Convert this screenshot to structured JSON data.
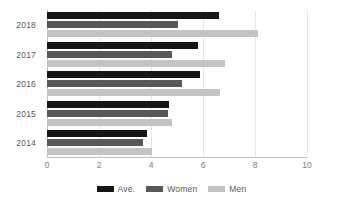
{
  "chart_data": {
    "type": "bar",
    "orientation": "horizontal",
    "title": "",
    "subtitle": "",
    "xlabel": "",
    "ylabel": "",
    "categories": [
      "2018",
      "2017",
      "2016",
      "2015",
      "2014"
    ],
    "series": [
      {
        "name": "Ave.",
        "color": "#161616",
        "values": [
          6.6,
          5.8,
          5.9,
          4.7,
          3.85
        ]
      },
      {
        "name": "Women",
        "color": "#585858",
        "values": [
          5.05,
          4.8,
          5.2,
          4.65,
          3.7
        ]
      },
      {
        "name": "Men",
        "color": "#c4c4c4",
        "values": [
          8.1,
          6.85,
          6.65,
          4.8,
          4.05
        ]
      }
    ],
    "xlim": [
      0,
      10
    ],
    "xticks": [
      0,
      2,
      4,
      6,
      8,
      10
    ],
    "xticklabels": [
      "0",
      "2",
      "4",
      "6",
      "8",
      "10"
    ],
    "grid": true,
    "grid_axis": "x",
    "legend_position": "bottom-center",
    "legend_entries": [
      "Ave.",
      "Women",
      "Men"
    ]
  },
  "colors": {
    "background": "#ffffff",
    "axis": "#bfbfbf",
    "gridline": "#e6e6e6",
    "text": "#595959",
    "tick_text": "#7f7f7f",
    "series_ave": "#161616",
    "series_women": "#585858",
    "series_men": "#c4c4c4"
  }
}
